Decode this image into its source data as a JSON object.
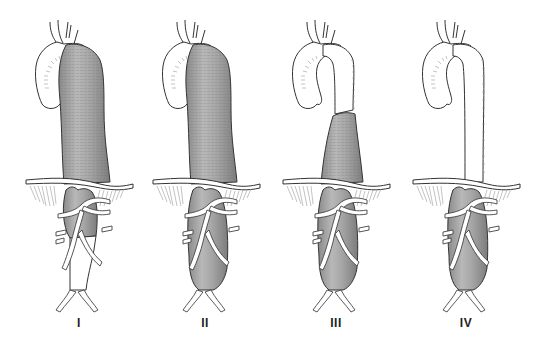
{
  "figure": {
    "colors": {
      "aneurysm": "#9c9c9c",
      "outline": "#333333",
      "background": "#ffffff"
    },
    "panels": [
      {
        "label": "I",
        "x": 0,
        "label_x": 79,
        "thoracic": "full",
        "abdominal": "upper"
      },
      {
        "label": "II",
        "x": 127,
        "label_x": 205,
        "thoracic": "full",
        "abdominal": "full"
      },
      {
        "label": "III",
        "x": 257,
        "label_x": 336,
        "thoracic": "lower",
        "abdominal": "full"
      },
      {
        "label": "IV",
        "x": 387,
        "label_x": 466,
        "thoracic": "none",
        "abdominal": "full"
      }
    ]
  }
}
